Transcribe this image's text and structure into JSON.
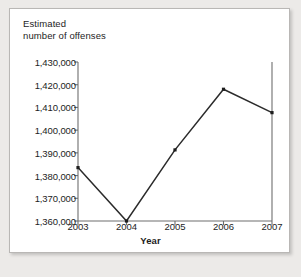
{
  "chart_data": {
    "type": "line",
    "title": "",
    "xlabel": "Year",
    "ylabel": "Estimated\nnumber of offenses",
    "categories": [
      "2003",
      "2004",
      "2005",
      "2006",
      "2007"
    ],
    "x": [
      2003,
      2004,
      2005,
      2006,
      2007
    ],
    "values": [
      1383500,
      1360000,
      1391300,
      1418000,
      1407700
    ],
    "series": [
      {
        "name": "Estimated number of offenses",
        "values": [
          1383500,
          1360000,
          1391300,
          1418000,
          1407700
        ]
      }
    ],
    "ylim": [
      1360000,
      1430000
    ],
    "xlim": [
      2003,
      2007
    ],
    "y_ticks": [
      1360000,
      1370000,
      1380000,
      1390000,
      1400000,
      1410000,
      1420000,
      1430000
    ],
    "y_tick_labels": [
      "1,360,000",
      "1,370,000",
      "1,380,000",
      "1,390,000",
      "1,400,000",
      "1,410,000",
      "1,420,000",
      "1,430,000"
    ],
    "x_tick_labels": [
      "2003",
      "2004",
      "2005",
      "2006",
      "2007"
    ],
    "grid": false,
    "legend": false,
    "legend_position": "none",
    "marker": "square",
    "line_color": "#2b2b2b",
    "marker_color": "#1d1d1d",
    "axis_color": "#6e6e6e",
    "background_color": "#ffffff",
    "page_background_color": "#eceae8",
    "annotations": []
  },
  "figure": {
    "y_axis_title": "Estimated\nnumber of offenses",
    "x_axis_title": "Year"
  }
}
